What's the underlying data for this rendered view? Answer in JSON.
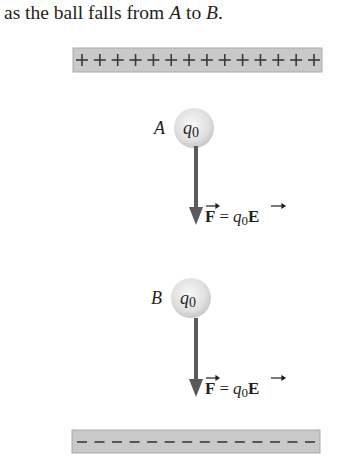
{
  "caption": {
    "before_a": "as the ball falls from ",
    "point_a": "A",
    "middle": " to ",
    "point_b": "B",
    "after": "."
  },
  "top_plate": {
    "sign": "+",
    "count": 14,
    "charge": "positive"
  },
  "bottom_plate": {
    "sign": "-",
    "count": 14,
    "charge": "negative"
  },
  "ball_a": {
    "position_label": "A",
    "charge_label": "q",
    "charge_subscript": "0"
  },
  "ball_b": {
    "position_label": "B",
    "charge_label": "q",
    "charge_subscript": "0"
  },
  "force_a": {
    "lhs": "F",
    "equals": "=",
    "q": "q",
    "q_sub": "0",
    "field": "E"
  },
  "force_b": {
    "lhs": "F",
    "equals": "=",
    "q": "q",
    "q_sub": "0",
    "field": "E"
  },
  "colors": {
    "plate": "#c8c8c8",
    "plate_border": "#a8a8a8",
    "arrow": "#5a5a5a",
    "ball": "#e2e2e2",
    "text": "#231f20"
  }
}
